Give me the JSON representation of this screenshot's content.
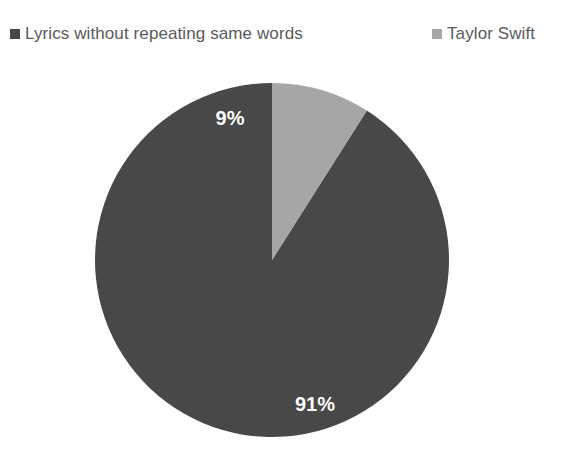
{
  "chart_data": {
    "type": "pie",
    "title": "",
    "subtitle": "",
    "xlabel": "",
    "ylabel": "",
    "legend_position": "top",
    "grid": false,
    "categories": [
      "Lyrics without repeating same words",
      "Taylor Swift"
    ],
    "values": [
      91,
      9
    ],
    "value_labels": [
      "91%",
      "9%"
    ],
    "colors": [
      "#484848",
      "#a6a6a6"
    ],
    "slices": [
      {
        "name": "Lyrics without repeating same words",
        "value": 91,
        "label": "91%",
        "color": "#484848",
        "label_color": "#ffffff"
      },
      {
        "name": "Taylor Swift",
        "value": 9,
        "label": "9%",
        "color": "#a6a6a6",
        "label_color": "#ffffff"
      }
    ],
    "start_angle_deg": 0,
    "direction": "counterclockwise",
    "units": "percent"
  },
  "legend": {
    "items": [
      {
        "label": "Lyrics without repeating same words",
        "marker": "square",
        "color": "#484848"
      },
      {
        "label": "Taylor Swift",
        "marker": "square",
        "color": "#a6a6a6"
      }
    ],
    "text_color": "#5a5a5a"
  },
  "plot": {
    "background": "#ffffff",
    "center_x": 272,
    "center_y": 198,
    "radius": 177
  }
}
